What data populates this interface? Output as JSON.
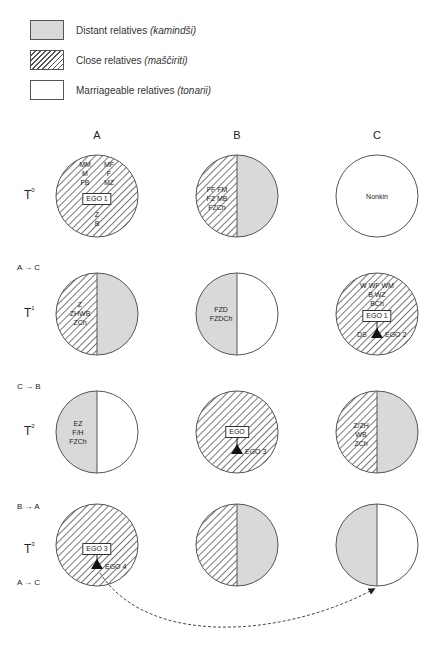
{
  "legend": [
    {
      "fill": "distant",
      "label": "Distant relatives ",
      "term": "(kamindši)"
    },
    {
      "fill": "close",
      "label": "Close relatives ",
      "term": "(maščiriti)"
    },
    {
      "fill": "marriageable",
      "label": "Marriageable relatives ",
      "term": "(tonarii)"
    }
  ],
  "colors": {
    "distant": "#d9d9d9",
    "hatch": "#555555",
    "outline": "#555555",
    "arrow": "#333333"
  },
  "columns": [
    "A",
    "B",
    "C"
  ],
  "rows": [
    {
      "label": "T",
      "sup": "0",
      "shift_above": "",
      "shift_below": ""
    },
    {
      "label": "T",
      "sup": "1",
      "shift_above": "A → C",
      "shift_below": ""
    },
    {
      "label": "T",
      "sup": "2",
      "shift_above": "C → B",
      "shift_below": ""
    },
    {
      "label": "T",
      "sup": "3",
      "shift_above": "B → A",
      "shift_below": "A → C"
    }
  ],
  "cells": {
    "A0": {
      "left": "close",
      "right": "close",
      "kin_left": [
        "MM",
        "M",
        "FB"
      ],
      "kin_right": [
        "MF",
        "F",
        "MZ"
      ],
      "ego_box": "EGO 1",
      "kin_below": [
        "Z",
        "B"
      ]
    },
    "B0": {
      "left": "close",
      "right": "distant",
      "kin": [
        "FF  FM",
        "FZ  MB",
        "FZCh"
      ]
    },
    "C0": {
      "left": "marriageable",
      "right": "marriageable",
      "kin": [
        "Nonkin"
      ]
    },
    "A1": {
      "left": "close",
      "right": "distant",
      "kin": [
        "Z",
        "ZHWB",
        "ZCh"
      ]
    },
    "B1": {
      "left": "distant",
      "right": "marriageable",
      "kin": [
        "FZD",
        "FZDCh"
      ]
    },
    "C1": {
      "left": "close",
      "right": "close",
      "kin": [
        "W WF WM",
        "B  WZ",
        "BCh"
      ],
      "ego_box": "EGO 1",
      "child_left": "DS",
      "child_right": "EGO 2"
    },
    "A2": {
      "left": "distant",
      "right": "marriageable",
      "kin": [
        "EZ",
        "F/H",
        "FZCh"
      ]
    },
    "B2": {
      "left": "close",
      "right": "close",
      "ego_box": "EGO",
      "child_right": "EGO 3"
    },
    "C2": {
      "left": "close",
      "right": "distant",
      "kin": [
        "Z/ZH",
        "WB",
        "ZCh"
      ]
    },
    "A3": {
      "left": "close",
      "right": "close",
      "ego_box": "EGO 3",
      "child_right": "EGO 4"
    },
    "B3": {
      "left": "close",
      "right": "distant"
    },
    "C3": {
      "left": "distant",
      "right": "marriageable"
    }
  }
}
